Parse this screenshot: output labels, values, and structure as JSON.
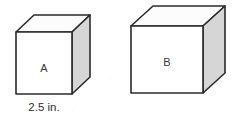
{
  "figure": {
    "kind": "two-cubes-comparison-diagram",
    "background_color": "#ffffff",
    "outline_color": "#2b2b2b",
    "front_face_color": "#ffffff",
    "top_face_color": "#fcfcfc",
    "side_face_color": "#d6d6d6",
    "label_color": "#3a3a3a"
  },
  "cubes": [
    {
      "label": "A",
      "dimension_label": "2.5 in.",
      "label_x": 44,
      "label_y": 69,
      "dimension_x": 44,
      "dimension_y": 108,
      "front": "16,32 72,32 72,94 16,94",
      "top": "16,32 34,15 90,15 72,32",
      "side": "72,32 90,15 90,77 72,94"
    },
    {
      "label": "B",
      "dimension_label": "",
      "label_x": 167,
      "label_y": 63,
      "front": "131,26 203,26 203,93 131,93",
      "top": "131,26 153,6 225,6 203,26",
      "side": "203,26 225,6 225,73 203,93"
    }
  ]
}
